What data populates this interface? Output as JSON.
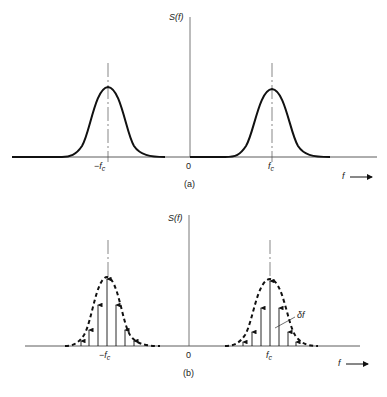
{
  "figure": {
    "panel_a": {
      "caption": "(a)",
      "y_label": "S(f)",
      "x_label": "f",
      "ticks": {
        "neg_fc": "−f",
        "zero": "0",
        "pos_fc": "f",
        "subscript": "c"
      },
      "description": "Continuous spectrum with bell-shaped lobes centered at −fc and +fc"
    },
    "panel_b": {
      "caption": "(b)",
      "y_label": "S(f)",
      "x_label": "f",
      "ticks": {
        "neg_fc": "−f",
        "zero": "0",
        "pos_fc": "f",
        "subscript": "c"
      },
      "spacing_label": "δf",
      "description": "Sampled spectrum: impulses spaced δf apart under dashed envelope centered at −fc and +fc"
    }
  },
  "colors": {
    "ink": "#111111",
    "background": "#ffffff"
  }
}
